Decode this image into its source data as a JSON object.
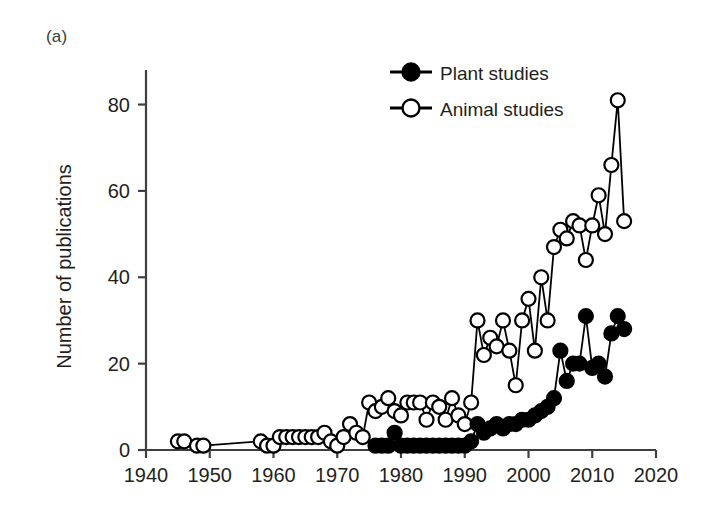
{
  "panel": {
    "label": "(a)"
  },
  "axes": {
    "ylabel": "Number of publications",
    "yticks": [
      0,
      20,
      40,
      60,
      80
    ],
    "xticks": [
      1940,
      1950,
      1960,
      1970,
      1980,
      1990,
      2000,
      2010,
      2020
    ],
    "xlim": [
      1940,
      2020
    ],
    "ylim": [
      0,
      88
    ]
  },
  "legend": {
    "plant": "Plant studies",
    "animal": "Animal studies"
  },
  "colors": {
    "line": "#000000",
    "plant_fill": "#000000",
    "animal_fill": "#ffffff",
    "text": "#231f20",
    "axis": "#3f3f3f",
    "background": "#ffffff"
  },
  "chart_data": {
    "type": "line",
    "title": "",
    "subtitle": "",
    "xlabel": "",
    "ylabel": "Number of publications",
    "xlim": [
      1940,
      2020
    ],
    "ylim": [
      0,
      88
    ],
    "grid": false,
    "legend_position": "top-center",
    "annotations": [
      "(a)"
    ],
    "series": [
      {
        "name": "Animal studies",
        "marker": "open-circle",
        "points": [
          [
            1945,
            2
          ],
          [
            1946,
            2
          ],
          [
            1948,
            1
          ],
          [
            1949,
            1
          ],
          [
            1958,
            2
          ],
          [
            1959,
            1
          ],
          [
            1960,
            1
          ],
          [
            1961,
            3
          ],
          [
            1962,
            3
          ],
          [
            1963,
            3
          ],
          [
            1964,
            3
          ],
          [
            1965,
            3
          ],
          [
            1966,
            3
          ],
          [
            1967,
            3
          ],
          [
            1968,
            4
          ],
          [
            1969,
            2
          ],
          [
            1970,
            1
          ],
          [
            1971,
            3
          ],
          [
            1972,
            6
          ],
          [
            1973,
            4
          ],
          [
            1974,
            3
          ],
          [
            1975,
            11
          ],
          [
            1976,
            9
          ],
          [
            1977,
            10
          ],
          [
            1978,
            12
          ],
          [
            1979,
            9
          ],
          [
            1980,
            8
          ],
          [
            1981,
            11
          ],
          [
            1982,
            11
          ],
          [
            1983,
            11
          ],
          [
            1984,
            7
          ],
          [
            1985,
            11
          ],
          [
            1986,
            10
          ],
          [
            1987,
            7
          ],
          [
            1988,
            12
          ],
          [
            1989,
            8
          ],
          [
            1990,
            6
          ],
          [
            1991,
            11
          ],
          [
            1992,
            30
          ],
          [
            1993,
            22
          ],
          [
            1994,
            26
          ],
          [
            1995,
            24
          ],
          [
            1996,
            30
          ],
          [
            1997,
            23
          ],
          [
            1998,
            15
          ],
          [
            1999,
            30
          ],
          [
            2000,
            35
          ],
          [
            2001,
            23
          ],
          [
            2002,
            40
          ],
          [
            2003,
            30
          ],
          [
            2004,
            47
          ],
          [
            2005,
            51
          ],
          [
            2006,
            49
          ],
          [
            2007,
            53
          ],
          [
            2008,
            52
          ],
          [
            2009,
            44
          ],
          [
            2010,
            52
          ],
          [
            2011,
            59
          ],
          [
            2012,
            50
          ],
          [
            2013,
            66
          ],
          [
            2014,
            81
          ],
          [
            2015,
            53
          ]
        ]
      },
      {
        "name": "Plant studies",
        "marker": "filled-circle",
        "points": [
          [
            1976,
            1
          ],
          [
            1977,
            1
          ],
          [
            1978,
            1
          ],
          [
            1979,
            4
          ],
          [
            1980,
            1
          ],
          [
            1981,
            1
          ],
          [
            1982,
            1
          ],
          [
            1983,
            1
          ],
          [
            1984,
            1
          ],
          [
            1985,
            1
          ],
          [
            1986,
            1
          ],
          [
            1987,
            1
          ],
          [
            1988,
            1
          ],
          [
            1989,
            1
          ],
          [
            1990,
            1
          ],
          [
            1991,
            2
          ],
          [
            1992,
            6
          ],
          [
            1993,
            4
          ],
          [
            1994,
            5
          ],
          [
            1995,
            6
          ],
          [
            1996,
            5
          ],
          [
            1997,
            6
          ],
          [
            1998,
            6
          ],
          [
            1999,
            7
          ],
          [
            2000,
            7
          ],
          [
            2001,
            8
          ],
          [
            2002,
            9
          ],
          [
            2003,
            10
          ],
          [
            2004,
            12
          ],
          [
            2005,
            23
          ],
          [
            2006,
            16
          ],
          [
            2007,
            20
          ],
          [
            2008,
            20
          ],
          [
            2009,
            31
          ],
          [
            2010,
            19
          ],
          [
            2011,
            20
          ],
          [
            2012,
            17
          ],
          [
            2013,
            27
          ],
          [
            2014,
            31
          ],
          [
            2015,
            28
          ]
        ]
      }
    ]
  }
}
